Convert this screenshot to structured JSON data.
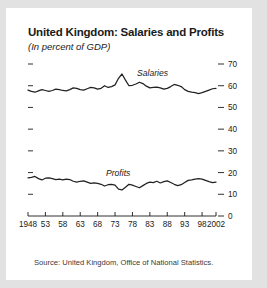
{
  "card": {
    "background": "#ffffff",
    "page_background": "#e2e2e2"
  },
  "header": {
    "title": "United Kingdom: Salaries and Profits",
    "subtitle": "(In percent of GDP)"
  },
  "footer": {
    "source": "Source: United Kingdom, Office of National Statistics."
  },
  "chart_data": {
    "type": "line",
    "title": "United Kingdom: Salaries and Profits",
    "subtitle": "(In percent of GDP)",
    "xlabel": "",
    "ylabel": "",
    "ylim": [
      0,
      70
    ],
    "xlim": [
      1948,
      2002
    ],
    "grid": false,
    "legend": "inline-labels",
    "y_axis_position": "right",
    "y_ticks": [
      0,
      10,
      20,
      30,
      40,
      50,
      60,
      70
    ],
    "y_tick_labels": [
      "0",
      "10",
      "20",
      "30",
      "40",
      "50",
      "60",
      "70"
    ],
    "left_axis_ticks_unlabeled": true,
    "x_ticks": [
      1948,
      1953,
      1958,
      1963,
      1968,
      1973,
      1978,
      1983,
      1988,
      1993,
      1998,
      2002
    ],
    "x_tick_labels": [
      "1948",
      "53",
      "58",
      "63",
      "68",
      "73",
      "78",
      "83",
      "88",
      "93",
      "98",
      "2002"
    ],
    "line_color": "#222222",
    "x": [
      1948,
      1949,
      1950,
      1951,
      1952,
      1953,
      1954,
      1955,
      1956,
      1957,
      1958,
      1959,
      1960,
      1961,
      1962,
      1963,
      1964,
      1965,
      1966,
      1967,
      1968,
      1969,
      1970,
      1971,
      1972,
      1973,
      1974,
      1975,
      1976,
      1977,
      1978,
      1979,
      1980,
      1981,
      1982,
      1983,
      1984,
      1985,
      1986,
      1987,
      1988,
      1989,
      1990,
      1991,
      1992,
      1993,
      1994,
      1995,
      1996,
      1997,
      1998,
      1999,
      2000,
      2001,
      2002
    ],
    "series": [
      {
        "name": "Salaries",
        "label": "Salaries",
        "values": [
          58.0,
          57.4,
          57.0,
          57.6,
          58.2,
          57.8,
          57.4,
          57.8,
          58.4,
          58.2,
          57.8,
          57.6,
          58.2,
          59.0,
          58.8,
          58.2,
          58.0,
          58.6,
          59.2,
          59.0,
          58.4,
          58.8,
          60.0,
          59.2,
          59.6,
          60.4,
          63.4,
          65.4,
          62.6,
          60.0,
          60.2,
          60.8,
          61.6,
          61.0,
          59.8,
          59.0,
          59.2,
          59.4,
          59.0,
          58.4,
          58.8,
          59.6,
          60.6,
          60.2,
          59.6,
          58.2,
          57.4,
          57.0,
          56.8,
          56.4,
          56.8,
          57.4,
          58.0,
          58.6,
          58.8
        ]
      },
      {
        "name": "Profits",
        "label": "Profits",
        "values": [
          17.6,
          17.8,
          18.2,
          17.2,
          16.6,
          17.4,
          17.6,
          17.2,
          16.8,
          17.0,
          16.6,
          17.0,
          16.8,
          16.0,
          15.6,
          16.0,
          16.2,
          15.6,
          15.0,
          15.2,
          15.0,
          14.6,
          13.8,
          14.4,
          14.6,
          14.2,
          12.4,
          12.0,
          13.2,
          14.6,
          14.2,
          13.6,
          13.0,
          14.0,
          15.0,
          15.6,
          15.4,
          16.0,
          15.2,
          15.8,
          16.2,
          15.4,
          14.6,
          14.0,
          14.4,
          15.4,
          16.4,
          16.6,
          17.0,
          17.2,
          17.0,
          16.4,
          15.8,
          15.4,
          15.6
        ]
      }
    ]
  }
}
